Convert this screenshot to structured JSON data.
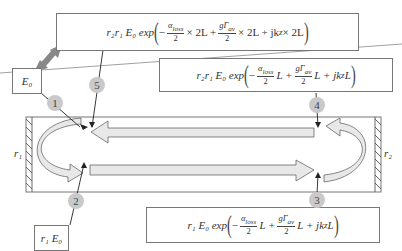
{
  "equations": {
    "eq5": {
      "prefix": "r₂r₁ E₀ exp",
      "minus": "−",
      "alpha": "α",
      "alpha_sub": "loss",
      "den": "2",
      "t1": "× 2L +",
      "gain": "gΓ",
      "gain_sub": "av",
      "t2": "× 2L + jk",
      "k_sub": "z",
      "t3": " × 2L"
    },
    "eq4": {
      "prefix": "r₂r₁ E₀ exp",
      "minus": "−",
      "alpha": "α",
      "alpha_sub": "loss",
      "den": "2",
      "t1": "L +",
      "gain": "gΓ",
      "gain_sub": "av",
      "t2": "L + jk",
      "k_sub": "z",
      "t3": "L"
    },
    "eq3": {
      "prefix": "r₁ E₀ exp",
      "minus": "−",
      "alpha": "α",
      "alpha_sub": "loss",
      "den": "2",
      "t1": "L +",
      "gain": "gΓ",
      "gain_sub": "av",
      "t2": "L + jk",
      "k_sub": "z",
      "t3": "L"
    },
    "e0": {
      "label": "E₀"
    },
    "r1e0": {
      "label": "r₁ E₀"
    }
  },
  "badges": [
    "1",
    "2",
    "3",
    "4",
    "5"
  ],
  "mirrors": {
    "left": "r₁",
    "right": "r₂"
  },
  "colors": {
    "arrow_fill": "#e8e8e8",
    "badge": "#c9c9c9",
    "connector": "#888888",
    "line": "#222222"
  }
}
